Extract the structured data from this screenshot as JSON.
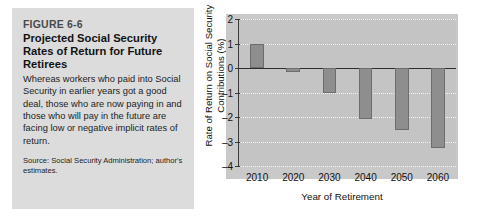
{
  "figure": {
    "number": "FIGURE 6-6",
    "title": "Projected Social Security Rates of Return for Future Retirees",
    "description": "Whereas workers who paid into Social Security in earlier years got a good deal, those who are now paying in and those who will pay in the future are facing low or negative implicit rates of return.",
    "source": "Source: Social Security Administration; author's estimates."
  },
  "chart_data": {
    "type": "bar",
    "title": "",
    "categories": [
      "2010",
      "2020",
      "2030",
      "2040",
      "2050",
      "2060"
    ],
    "values": [
      1.0,
      -0.15,
      -1.0,
      -2.1,
      -2.55,
      -3.25
    ],
    "xlabel": "Year of Retirement",
    "ylabel": "Rate of Return on Social Security Contributions (%)",
    "ylabel_line1": "Rate of Return on Social Security",
    "ylabel_line2": "Contributions (%)",
    "ylim": [
      -4,
      2
    ],
    "yticks": [
      2,
      1,
      0,
      -1,
      -2,
      -3,
      -4
    ],
    "ytick_labels": [
      "2",
      "1",
      "0",
      "–1",
      "–2",
      "–3",
      "–4"
    ],
    "grid": true,
    "legend": "none",
    "zero_line": 0
  },
  "colors": {
    "caption_panel": "#dcdcdc",
    "plot_background": "#c4c4c4",
    "bar_fill": "#8e8e8e",
    "bar_stroke": "#6d6d6d",
    "axis": "#2e2e2e",
    "gridline": "#f2f2f2"
  }
}
